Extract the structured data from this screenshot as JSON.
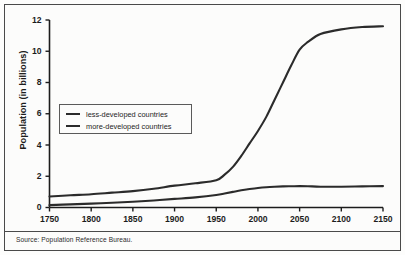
{
  "figure": {
    "source_note": "Source: Population Reference Bureau.",
    "border_color": "#4a4a4a",
    "background": "#fcfcfb"
  },
  "chart_data": {
    "type": "line",
    "title": "",
    "xlabel": "",
    "ylabel": "Population (in billions)",
    "xlim": [
      1750,
      2150
    ],
    "ylim": [
      0,
      12
    ],
    "xticks": [
      1750,
      1800,
      1850,
      1900,
      1950,
      2000,
      2050,
      2100,
      2150
    ],
    "yticks": [
      0,
      2,
      4,
      6,
      8,
      10,
      12
    ],
    "xtick_labels": [
      "1750",
      "1800",
      "1850",
      "1900",
      "1950",
      "2000",
      "2050",
      "2100",
      "2150"
    ],
    "ytick_labels": [
      "0",
      "2",
      "4",
      "6",
      "8",
      "10",
      "12"
    ],
    "grid": false,
    "legend_position": "center-left",
    "line_color": "#2b2b2b",
    "x": [
      1750,
      1775,
      1800,
      1825,
      1850,
      1875,
      1900,
      1925,
      1950,
      1960,
      1970,
      1980,
      1990,
      2000,
      2010,
      2020,
      2030,
      2040,
      2050,
      2060,
      2075,
      2100,
      2125,
      2150
    ],
    "series": [
      {
        "name": "less-developed countries",
        "values": [
          0.7,
          0.78,
          0.85,
          0.95,
          1.05,
          1.2,
          1.4,
          1.55,
          1.75,
          2.1,
          2.6,
          3.3,
          4.1,
          4.9,
          5.8,
          6.9,
          8.0,
          9.1,
          10.1,
          10.6,
          11.1,
          11.4,
          11.55,
          11.6
        ]
      },
      {
        "name": "more-developed countries",
        "values": [
          0.15,
          0.2,
          0.25,
          0.3,
          0.37,
          0.45,
          0.55,
          0.65,
          0.8,
          0.9,
          1.0,
          1.1,
          1.18,
          1.25,
          1.3,
          1.33,
          1.35,
          1.36,
          1.37,
          1.36,
          1.33,
          1.33,
          1.35,
          1.37
        ]
      }
    ]
  },
  "legend": {
    "entries": [
      {
        "label": "less-developed countries"
      },
      {
        "label": "more-developed countries"
      }
    ]
  }
}
